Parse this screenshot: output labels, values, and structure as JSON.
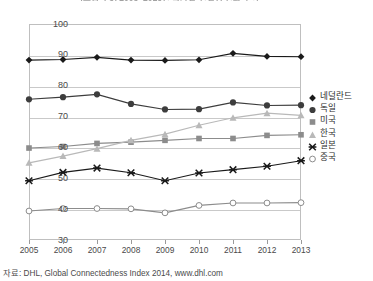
{
  "chart_data": {
    "type": "line",
    "title": "[그림 4-3] 2005~2013년 국가별 연결성 변화 추이",
    "subtitle": "",
    "xlabel": "",
    "ylabel": "",
    "x": [
      2005,
      2006,
      2007,
      2008,
      2009,
      2010,
      2011,
      2012,
      2013
    ],
    "categories": [
      "2005",
      "2006",
      "2007",
      "2008",
      "2009",
      "2010",
      "2011",
      "2012",
      "2013"
    ],
    "xlim": [
      2005,
      2013
    ],
    "ylim": [
      30,
      100
    ],
    "yticks": [
      30,
      40,
      50,
      60,
      70,
      80,
      90,
      100
    ],
    "grid": true,
    "legend_position": "right",
    "series": [
      {
        "name": "네덜란드",
        "marker": "diamond",
        "color": "#1a1a1a",
        "values": [
          88.3,
          88.5,
          89.2,
          88.3,
          88.2,
          88.4,
          90.5,
          89.5,
          89.4
        ]
      },
      {
        "name": "독일",
        "marker": "circle",
        "color": "#3d3d3d",
        "values": [
          75.6,
          76.3,
          77.2,
          74.1,
          72.3,
          72.4,
          74.6,
          73.6,
          73.7
        ]
      },
      {
        "name": "미국",
        "marker": "square",
        "color": "#8c8c8c",
        "values": [
          59.8,
          60.3,
          61.3,
          61.7,
          62.3,
          62.9,
          62.9,
          63.9,
          64.1
        ]
      },
      {
        "name": "한국",
        "marker": "triangle",
        "color": "#b9b9b9",
        "values": [
          55.0,
          57.2,
          59.6,
          62.3,
          64.3,
          67.2,
          69.6,
          71.1,
          70.4
        ]
      },
      {
        "name": "일본",
        "marker": "x",
        "color": "#1a1a1a",
        "values": [
          49.2,
          51.9,
          53.3,
          51.8,
          49.2,
          51.7,
          52.8,
          53.9,
          55.7
        ]
      },
      {
        "name": "중국",
        "marker": "open-circle",
        "color": "#8c8c8c",
        "values": [
          39.4,
          40.2,
          40.2,
          40.1,
          38.8,
          41.2,
          42.0,
          42.0,
          42.1
        ]
      }
    ]
  },
  "source": {
    "note": "자료: DHL, Global Connectedness Index 2014, www.dhl.com"
  }
}
